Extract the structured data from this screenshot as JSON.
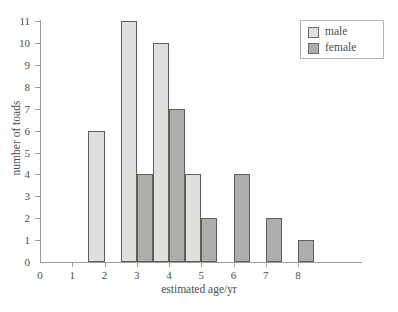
{
  "chart_data": {
    "type": "bar",
    "title": "",
    "subtitle": "",
    "xlabel": "estimated age/yr",
    "ylabel": "number of toads",
    "categories": [
      1,
      2,
      3,
      4,
      5,
      6,
      7,
      8
    ],
    "series": [
      {
        "name": "male",
        "color": "#dfdfdc",
        "values": [
          0,
          6,
          11,
          10,
          4,
          0,
          0,
          0
        ]
      },
      {
        "name": "female",
        "color": "#adadab",
        "values": [
          0,
          0,
          4,
          7,
          2,
          4,
          2,
          1
        ]
      }
    ],
    "xlim": [
      0,
      8
    ],
    "ylim": [
      0,
      11
    ],
    "xticks": [
      0,
      1,
      2,
      3,
      4,
      5,
      6,
      7,
      8
    ],
    "yticks": [
      0,
      1,
      2,
      3,
      4,
      5,
      6,
      7,
      8,
      9,
      10,
      11
    ],
    "grid": false,
    "legend_position": "top-right",
    "bar_layout": "male bar occupies half-interval left of each age tick; female bar occupies half-interval right of each age tick",
    "annotations": []
  },
  "axes": {
    "x_title": "estimated age/yr",
    "y_title": "number of toads",
    "x_tick_labels": [
      "0",
      "1",
      "2",
      "3",
      "4",
      "5",
      "6",
      "7",
      "8"
    ],
    "y_tick_labels": [
      "0",
      "1",
      "2",
      "3",
      "4",
      "5",
      "6",
      "7",
      "8",
      "9",
      "10",
      "11"
    ]
  },
  "legend": {
    "entries": [
      {
        "label": "male",
        "color": "#dfdfdc"
      },
      {
        "label": "female",
        "color": "#adadab"
      }
    ]
  },
  "colors": {
    "male": "#dfdfdc",
    "female": "#adadab",
    "bar_outline": "#5e5e5c",
    "axis": "#9b9b99",
    "text": "#4d4d4d",
    "background": "#ffffff"
  }
}
